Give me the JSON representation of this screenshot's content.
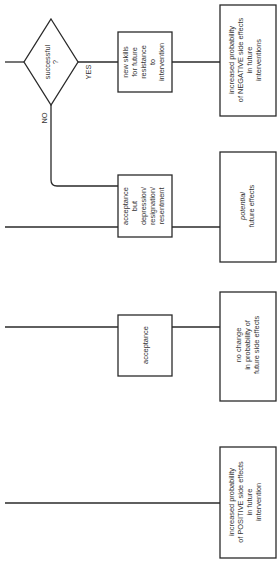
{
  "diagram": {
    "orientation": "rotated 90 degrees counter-clockwise",
    "decision": {
      "label": "successful",
      "label2": "?",
      "yes_label": "YES",
      "no_label": "NO"
    },
    "middle_boxes": [
      {
        "lines": [
          "new skills",
          "for future",
          "resistance",
          "to",
          "intervention"
        ]
      },
      {
        "lines": [
          "acceptance",
          "but",
          "depression/",
          "resignation/",
          "resentment"
        ]
      },
      {
        "lines": [
          "acceptance"
        ]
      }
    ],
    "outcome_boxes": [
      {
        "lines": [
          "increased probability",
          "of NEGATIVE side effects",
          "in future",
          "interventions"
        ]
      },
      {
        "lines": [
          "potential",
          "future effects"
        ],
        "italic_first": true
      },
      {
        "lines": [
          "no change",
          "in probability of",
          "future side effects"
        ]
      },
      {
        "lines": [
          "increased probability",
          "of POSITIVE side effects",
          "in future",
          "intervention"
        ]
      }
    ]
  },
  "colors": {
    "line": "#2a2a2a",
    "text": "#333333",
    "background": "#ffffff"
  }
}
